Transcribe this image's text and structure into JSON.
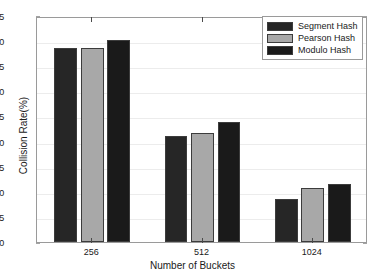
{
  "chart_data": {
    "type": "bar",
    "title": "",
    "xlabel": "Number of Buckets",
    "ylabel": "Collision Rate(%)",
    "categories": [
      "256",
      "512",
      "1024"
    ],
    "series": [
      {
        "name": "Segment Hash",
        "color": "#262626",
        "values": [
          38.6,
          21.1,
          8.5
        ]
      },
      {
        "name": "Pearson Hash",
        "color": "#a8a8a8",
        "values": [
          38.6,
          21.8,
          10.8
        ]
      },
      {
        "name": "Modulo Hash",
        "color": "#1a1a1a",
        "values": [
          40.3,
          23.8,
          11.5
        ]
      }
    ],
    "ylim": [
      0,
      45
    ],
    "yticks": [
      0,
      5,
      10,
      15,
      20,
      25,
      30,
      35,
      40,
      45
    ],
    "ytick_labels": [
      "0",
      "5",
      "10",
      "15",
      "20",
      "25",
      "30",
      "35",
      "40",
      "45"
    ],
    "grid": true,
    "grid_axis": "y",
    "legend_position": "upper right",
    "legend_entries": [
      "Segment Hash",
      "Pearson Hash",
      "Modulo Hash"
    ]
  },
  "legend": {
    "items": [
      {
        "label": "Segment Hash"
      },
      {
        "label": "Pearson Hash"
      },
      {
        "label": "Modulo Hash"
      }
    ]
  },
  "axes": {
    "ylabel": "Collision Rate(%)",
    "xlabel": "Number of Buckets"
  },
  "colors": {
    "series_1": "#262626",
    "series_2": "#a8a8a8",
    "series_3": "#1a1a1a",
    "axis": "#9a9a9a",
    "grid": "#ececec",
    "text": "#1a1a1a",
    "background": "#ffffff"
  }
}
